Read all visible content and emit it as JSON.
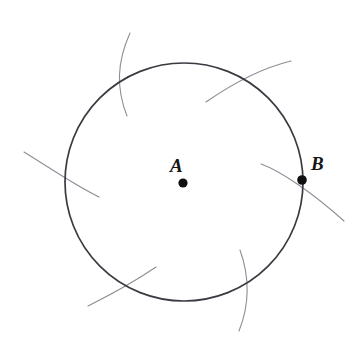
{
  "figure": {
    "background_color": "#ffffff",
    "canvas": {
      "width": 362,
      "height": 350
    }
  },
  "style": {
    "circle_stroke_color": "#3a3a42",
    "circle_stroke_width": 1.7,
    "arc_stroke_color": "#8d8d96",
    "arc_stroke_width": 1.1,
    "point_fill_color": "#101010",
    "label_color": "#151515"
  },
  "geometry": {
    "circle": {
      "name": "main-circle",
      "center_x": 184,
      "center_y": 182,
      "radius": 119
    },
    "points": [
      {
        "id": "A",
        "label": "A",
        "role": "center",
        "x": 183,
        "y": 183,
        "radius": 4.6,
        "label_offset_x": -13,
        "label_offset_y": -27
      },
      {
        "id": "B",
        "label": "B",
        "role": "on-circle",
        "x": 302,
        "y": 180,
        "radius": 4.8,
        "label_offset_x": 9,
        "label_offset_y": -26
      }
    ],
    "construction_arcs": [
      {
        "id": "arc-top",
        "description": "near-vertical arc crossing the circle at the top-left of the crown",
        "path": "M 130 33 C 117 62, 116 88, 127 116"
      },
      {
        "id": "arc-top-right",
        "description": "arc sweeping from inside the upper-right of the circle outward to the upper right",
        "path": "M 206 102 C 232 84, 262 68, 291 61"
      },
      {
        "id": "arc-left",
        "description": "arc entering from the left margin crossing the circle's left edge",
        "path": "M 24 152 C 50 168, 76 186, 99 197"
      },
      {
        "id": "arc-right",
        "description": "arc passing directly through point B, from inside the circle out to the lower right",
        "path": "M 261 164 C 281 171, 314 194, 344 221"
      },
      {
        "id": "arc-bottom-left",
        "description": "arc from the lower-left margin rising to inside the circle's lower area",
        "path": "M 88 306 C 112 294, 137 280, 156 267"
      },
      {
        "id": "arc-bottom-right",
        "description": "near-vertical arc crossing the circle's lower-right boundary",
        "path": "M 240 250 C 250 278, 249 306, 239 331"
      }
    ]
  },
  "labels": {
    "point_a": "A",
    "point_b": "B"
  }
}
